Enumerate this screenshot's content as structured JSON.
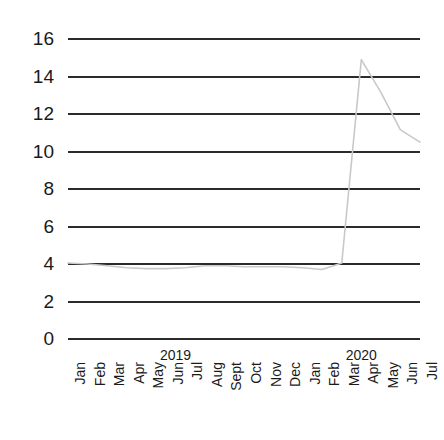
{
  "chart_data": {
    "type": "line",
    "title": "",
    "xlabel": "",
    "ylabel": "",
    "ylim": [
      0,
      16
    ],
    "yticks": [
      0,
      2,
      4,
      6,
      8,
      10,
      12,
      14,
      16
    ],
    "grid": true,
    "legend": "none",
    "line_color": "#c9c9c9",
    "grid_color": "#2b2b2b",
    "axis_text_color": "#1a1a1a",
    "categories": [
      "Jan",
      "Feb",
      "Mar",
      "Apr",
      "May",
      "Jun",
      "Jul",
      "Aug",
      "Sept",
      "Oct",
      "Nov",
      "Dec",
      "Jan",
      "Feb",
      "Mar",
      "Apr",
      "May",
      "Jun",
      "Jul"
    ],
    "year_groups": [
      {
        "label": "2019",
        "start_index": 0,
        "end_index": 11
      },
      {
        "label": "2020",
        "start_index": 12,
        "end_index": 18
      }
    ],
    "values": [
      4.0,
      3.95,
      3.85,
      3.75,
      3.7,
      3.7,
      3.75,
      3.85,
      3.85,
      3.8,
      3.8,
      3.8,
      3.75,
      3.65,
      4.0,
      14.85,
      13.1,
      11.1,
      10.45
    ]
  }
}
